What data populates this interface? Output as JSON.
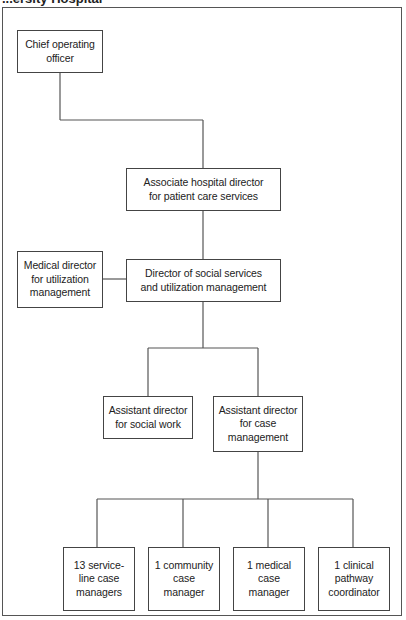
{
  "caption": "...ersity Hospital",
  "nodes": {
    "coo": "Chief operating\nofficer",
    "associate": "Associate hospital director\nfor patient care services",
    "medical": "Medical director\nfor utilization\nmanagement",
    "director": "Director of social services\nand utilization management",
    "asst_social": "Assistant director\nfor social work",
    "asst_case": "Assistant director\nfor case\nmanagement",
    "service_line": "13 service-\nline case\nmanagers",
    "community": "1 community\ncase\nmanager",
    "medical_cm": "1 medical\ncase\nmanager",
    "clinical": "1 clinical\npathway\ncoordinator"
  }
}
